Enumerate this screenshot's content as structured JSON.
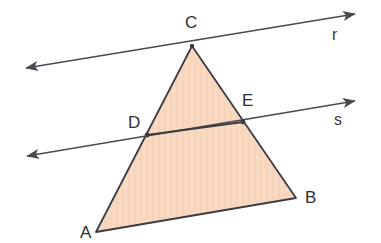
{
  "figure": {
    "background_color": "#ffffff"
  },
  "colors": {
    "triangle_fill": "#f7d6bd",
    "triangle_stroke": "#3c3c44",
    "line_stroke": "#4a4a52",
    "label_color": "#2e2e33"
  },
  "triangle": {
    "name": "triangle-ABC",
    "fill": "#f7d6bd",
    "stroke": "#3c3c44",
    "stroke_width": 1.8,
    "vertices": [
      {
        "id": "A",
        "label": "A",
        "x": 96,
        "y": 232,
        "label_x": 80,
        "label_y": 224
      },
      {
        "id": "B",
        "label": "B",
        "x": 296,
        "y": 198,
        "label_x": 305,
        "label_y": 189
      },
      {
        "id": "C",
        "label": "C",
        "x": 192,
        "y": 46,
        "label_x": 185,
        "label_y": 14
      }
    ]
  },
  "points": [
    {
      "id": "D",
      "label": "D",
      "x": 147,
      "y": 135,
      "label_x": 128,
      "label_y": 114,
      "on_segment": "AC",
      "on_line": "s"
    },
    {
      "id": "E",
      "label": "E",
      "x": 243,
      "y": 122,
      "label_x": 242,
      "label_y": 92,
      "on_segment": "BC",
      "on_line": "s"
    }
  ],
  "lines": [
    {
      "id": "r",
      "label": "r",
      "description": "transversal through vertex C",
      "x1": 26,
      "y1": 68,
      "x2": 355,
      "y2": 14,
      "label_x": 332,
      "label_y": 27,
      "arrow_start": true,
      "arrow_end": true,
      "stroke": "#4a4a52",
      "stroke_width": 1.6
    },
    {
      "id": "s",
      "label": "s",
      "description": "transversal through points D and E, parallel to r",
      "x1": 27,
      "y1": 156,
      "x2": 355,
      "y2": 101,
      "label_x": 334,
      "label_y": 112,
      "arrow_start": true,
      "arrow_end": true,
      "stroke": "#4a4a52",
      "stroke_width": 1.6
    }
  ],
  "segments": [
    {
      "id": "DE",
      "from": "D",
      "to": "E",
      "stroke": "#3c3c44",
      "stroke_width": 1.8
    }
  ]
}
